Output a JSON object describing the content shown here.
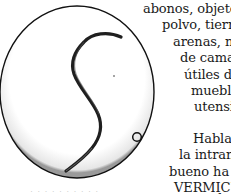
{
  "figure": {
    "colors": {
      "outline": "#111111",
      "worm": "#222222",
      "shadow": "#bdbdbd"
    }
  },
  "text": {
    "lines": [
      {
        "text": "abonos,  objetos,",
        "x": 143,
        "y": 2
      },
      {
        "text": "polvo,   tierra",
        "x": 162,
        "y": 18
      },
      {
        "text": "arenas,    n",
        "x": 173,
        "y": 35
      },
      {
        "text": "de cama,",
        "x": 180,
        "y": 51
      },
      {
        "text": "útiles  de",
        "x": 184,
        "y": 68
      },
      {
        "text": "muebles,",
        "x": 191,
        "y": 84
      },
      {
        "text": "utensilio",
        "x": 194,
        "y": 100
      },
      {
        "text": "Habla",
        "x": 193,
        "y": 132
      },
      {
        "text": "la  intranc",
        "x": 179,
        "y": 148
      },
      {
        "text": "bueno     ha",
        "x": 169,
        "y": 165
      },
      {
        "text": "VERMICUL",
        "x": 174,
        "y": 181
      },
      {
        "text": "d",
        "x": 214,
        "y": 192
      }
    ]
  },
  "caption": {
    "text": "·  ·  ·  ·  ·  ·  ·  ·  ·  ·"
  }
}
